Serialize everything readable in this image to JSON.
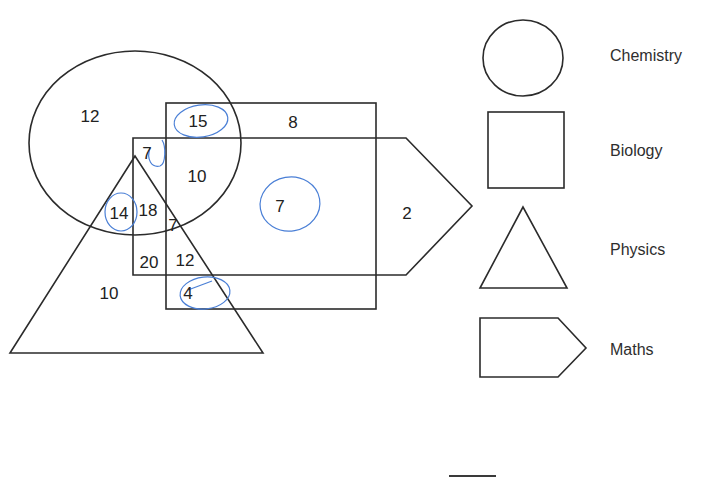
{
  "diagram": {
    "type": "venn-style subject overlap diagram",
    "sets": [
      {
        "id": "chemistry",
        "label": "Chemistry",
        "shape": "circle"
      },
      {
        "id": "biology",
        "label": "Biology",
        "shape": "rectangle"
      },
      {
        "id": "physics",
        "label": "Physics",
        "shape": "triangle"
      },
      {
        "id": "maths",
        "label": "Maths",
        "shape": "pentagon"
      }
    ],
    "regions": [
      {
        "id": "chem_only",
        "sets": [
          "chemistry"
        ],
        "value": "12",
        "circled": false
      },
      {
        "id": "chem_bio",
        "sets": [
          "chemistry",
          "biology"
        ],
        "value": "15",
        "circled": true
      },
      {
        "id": "bio_only",
        "sets": [
          "biology"
        ],
        "value": "8",
        "circled": false
      },
      {
        "id": "chem_maths_phys",
        "sets": [
          "chemistry",
          "maths",
          "physics"
        ],
        "value": "7",
        "circled": true
      },
      {
        "id": "chem_bio_maths",
        "sets": [
          "chemistry",
          "biology",
          "maths"
        ],
        "value": "10",
        "circled": false
      },
      {
        "id": "bio_maths",
        "sets": [
          "biology",
          "maths"
        ],
        "value": "7",
        "circled": true
      },
      {
        "id": "maths_only",
        "sets": [
          "maths"
        ],
        "value": "2",
        "circled": false
      },
      {
        "id": "chem_phys",
        "sets": [
          "chemistry",
          "physics"
        ],
        "value": "14",
        "circled": true
      },
      {
        "id": "chem_phys_maths_inner",
        "sets": [
          "chemistry",
          "physics",
          "maths"
        ],
        "value": "18",
        "circled": false
      },
      {
        "id": "all_four",
        "sets": [
          "chemistry",
          "physics",
          "maths",
          "biology"
        ],
        "value": "7",
        "circled": false
      },
      {
        "id": "phys_maths",
        "sets": [
          "physics",
          "maths"
        ],
        "value": "20",
        "circled": false
      },
      {
        "id": "phys_maths_bio",
        "sets": [
          "physics",
          "maths",
          "biology"
        ],
        "value": "12",
        "circled": false
      },
      {
        "id": "phys_only",
        "sets": [
          "physics"
        ],
        "value": "10",
        "circled": false
      },
      {
        "id": "phys_bio",
        "sets": [
          "physics",
          "biology"
        ],
        "value": "4",
        "circled": true
      }
    ]
  },
  "legend": {
    "items": [
      {
        "shape": "circle",
        "label": "Chemistry"
      },
      {
        "shape": "square",
        "label": "Biology"
      },
      {
        "shape": "triangle",
        "label": "Physics"
      },
      {
        "shape": "pentagon",
        "label": "Maths"
      }
    ]
  },
  "colors": {
    "line": "#2b2b2b",
    "annotation": "#4a7fd6",
    "background": "#ffffff"
  }
}
